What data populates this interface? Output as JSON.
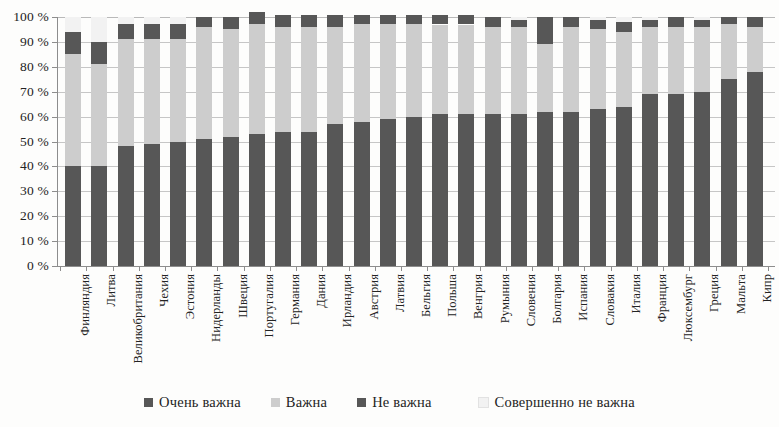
{
  "chart_data": {
    "type": "bar",
    "subtype": "stacked-bar-percentage",
    "title": "",
    "xlabel": "",
    "ylabel": "",
    "ylim": [
      0,
      100
    ],
    "ytick_labels": [
      "0 %",
      "10 %",
      "20 %",
      "30 %",
      "40 %",
      "50 %",
      "60 %",
      "70 %",
      "80 %",
      "90 %",
      "100 %"
    ],
    "ytick_values": [
      0,
      10,
      20,
      30,
      40,
      50,
      60,
      70,
      80,
      90,
      100
    ],
    "grid": true,
    "legend_position": "bottom",
    "categories": [
      "Финляндия",
      "Литва",
      "Великобритания",
      "Чехия",
      "Эстония",
      "Нидерланды",
      "Швеция",
      "Португалия",
      "Германия",
      "Дания",
      "Ирландия",
      "Австрия",
      "Латвия",
      "Бельгия",
      "Польша",
      "Венгрия",
      "Румыния",
      "Словения",
      "Болгария",
      "Испания",
      "Словакия",
      "Италия",
      "Франция",
      "Люксембург",
      "Греция",
      "Мальта",
      "Кипр"
    ],
    "series": [
      {
        "name": "Очень важна",
        "color": "#575757",
        "values": [
          40,
          40,
          48,
          49,
          50,
          51,
          52,
          53,
          54,
          54,
          57,
          58,
          59,
          60,
          61,
          61,
          61,
          61,
          62,
          62,
          63,
          64,
          69,
          69,
          70,
          75,
          78
        ]
      },
      {
        "name": "Важна",
        "color": "#cdcdcd",
        "values": [
          45,
          41,
          43,
          42,
          41,
          45,
          43,
          44,
          42,
          42,
          39,
          39,
          38,
          37,
          36,
          36,
          35,
          35,
          27,
          34,
          32,
          30,
          27,
          27,
          26,
          22,
          18
        ]
      },
      {
        "name": "Не важна",
        "color": "#575757",
        "values": [
          9,
          9,
          6,
          6,
          6,
          4,
          5,
          5,
          5,
          5,
          5,
          4,
          4,
          4,
          4,
          4,
          4,
          3,
          11,
          4,
          4,
          4,
          3,
          4,
          3,
          3,
          4
        ]
      },
      {
        "name": "Совершенно не важна",
        "color": "#f2f2f2",
        "values": [
          6,
          10,
          3,
          3,
          3,
          0,
          0,
          0,
          0,
          0,
          0,
          0,
          0,
          0,
          0,
          0,
          0,
          1,
          0,
          0,
          1,
          2,
          1,
          0,
          1,
          0,
          0
        ]
      }
    ],
    "bar_tops": [
      94,
      90,
      91,
      91,
      90,
      96,
      95,
      97,
      96,
      96,
      96,
      96,
      96,
      96,
      96,
      97,
      96,
      96,
      89,
      96,
      95,
      94,
      96,
      96,
      96,
      97,
      96
    ]
  },
  "legend": {
    "items": [
      {
        "label": "Очень важна",
        "color": "#575757"
      },
      {
        "label": "Важна",
        "color": "#cdcdcd"
      },
      {
        "label": "Не важна",
        "color": "#575757"
      },
      {
        "label": "Совершенно не важна",
        "color": "#f2f2f2"
      }
    ]
  }
}
